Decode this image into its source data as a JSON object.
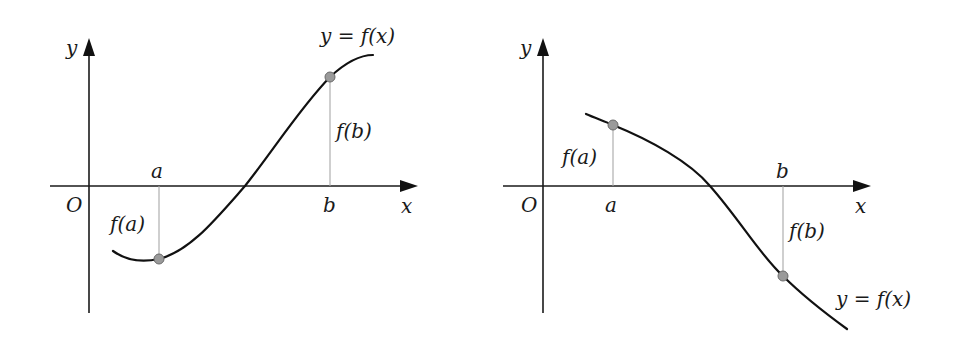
{
  "diagrams": [
    {
      "id": "increasing",
      "labels": {
        "y_axis": "y",
        "x_axis": "x",
        "origin": "O",
        "a": "a",
        "b": "b",
        "f_a": "f(a)",
        "f_b": "f(b)",
        "curve": "y = f(x)"
      },
      "description": "f(a) < 0 and f(b) > 0; curve crosses x-axis between a and b"
    },
    {
      "id": "decreasing",
      "labels": {
        "y_axis": "y",
        "x_axis": "x",
        "origin": "O",
        "a": "a",
        "b": "b",
        "f_a": "f(a)",
        "f_b": "f(b)",
        "curve": "y = f(x)"
      },
      "description": "f(a) > 0 and f(b) < 0; curve crosses x-axis between a and b"
    }
  ],
  "colors": {
    "curve": "#111111",
    "axis": "#1a1a1a",
    "guide": "#a8a8a8",
    "point_fill": "#9a9a9a",
    "background": "#ffffff"
  }
}
